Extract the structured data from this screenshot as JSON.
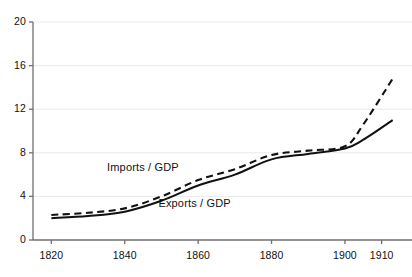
{
  "chart_data": {
    "type": "line",
    "title": "",
    "subtitle": "",
    "xlabel": "",
    "ylabel": "",
    "xlim": [
      1815,
      1915
    ],
    "ylim": [
      0,
      20
    ],
    "grid": true,
    "grid_color": "#eceaea",
    "axis_color": "#6f6f6f",
    "legend_position": "inline-annotation",
    "x_ticks": [
      1820,
      1840,
      1860,
      1880,
      1900,
      1910
    ],
    "x_tick_labels": [
      "1820",
      "1840",
      "1860",
      "1880",
      "1900",
      "1910"
    ],
    "y_ticks": [
      0,
      4,
      8,
      12,
      16,
      20
    ],
    "y_tick_labels": [
      "0",
      "4",
      "8",
      "12",
      "16",
      "20"
    ],
    "x": [
      1820,
      1830,
      1840,
      1850,
      1860,
      1870,
      1880,
      1890,
      1900,
      1905,
      1913
    ],
    "series": [
      {
        "name": "Imports / GDP",
        "style": "dashed",
        "color": "#111111",
        "label_x": 1845,
        "label_y": 6.6,
        "values": [
          2.3,
          2.5,
          2.9,
          4.0,
          5.5,
          6.5,
          7.8,
          8.2,
          8.6,
          10.6,
          14.8
        ]
      },
      {
        "name": "Exports / GDP",
        "style": "solid",
        "color": "#111111",
        "label_x": 1859,
        "label_y": 3.3,
        "values": [
          2.0,
          2.2,
          2.6,
          3.6,
          5.0,
          6.0,
          7.4,
          7.9,
          8.4,
          9.2,
          11.0
        ]
      }
    ]
  },
  "axes": {
    "y_axis_name": "value-axis",
    "x_axis_name": "year-axis"
  }
}
